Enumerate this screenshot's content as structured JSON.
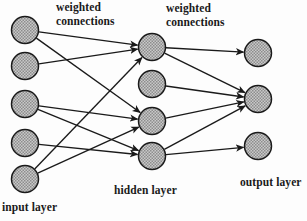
{
  "diagram": {
    "type": "neural-network-architecture",
    "title": "",
    "labels": {
      "weighted_connections_1": "weighted\nconnections",
      "weighted_connections_2": "weighted\nconnections",
      "hidden_layer": "hidden layer",
      "output_layer": "output layer",
      "input_layer": "input layer"
    },
    "colors": {
      "node_fill": "#a8a8a8",
      "node_stroke": "#1a1a1a",
      "edge": "#1a1a1a",
      "text": "#1a1a1a",
      "background": "#fdfdfd"
    },
    "node_radius": 13.5,
    "layers": [
      {
        "name": "input layer",
        "id": "input",
        "count": 5,
        "nodes": [
          {
            "id": "i1",
            "cx": 25,
            "cy": 30
          },
          {
            "id": "i2",
            "cx": 25,
            "cy": 66
          },
          {
            "id": "i3",
            "cx": 25,
            "cy": 104
          },
          {
            "id": "i4",
            "cx": 25,
            "cy": 143
          },
          {
            "id": "i5",
            "cx": 25,
            "cy": 179
          }
        ]
      },
      {
        "name": "hidden layer",
        "id": "hidden",
        "count": 4,
        "nodes": [
          {
            "id": "h1",
            "cx": 152,
            "cy": 47
          },
          {
            "id": "h2",
            "cx": 152,
            "cy": 84
          },
          {
            "id": "h3",
            "cx": 152,
            "cy": 121
          },
          {
            "id": "h4",
            "cx": 152,
            "cy": 156
          }
        ]
      },
      {
        "name": "output layer",
        "id": "output",
        "count": 3,
        "nodes": [
          {
            "id": "o1",
            "cx": 258,
            "cy": 53
          },
          {
            "id": "o2",
            "cx": 258,
            "cy": 99
          },
          {
            "id": "o3",
            "cx": 258,
            "cy": 146
          }
        ]
      }
    ],
    "edges": [
      {
        "from": "i1",
        "to": "h1"
      },
      {
        "from": "i1",
        "to": "h3"
      },
      {
        "from": "i2",
        "to": "h1"
      },
      {
        "from": "i3",
        "to": "h3"
      },
      {
        "from": "i3",
        "to": "h4"
      },
      {
        "from": "i4",
        "to": "h4"
      },
      {
        "from": "i5",
        "to": "h1"
      },
      {
        "from": "i5",
        "to": "h3"
      },
      {
        "from": "h1",
        "to": "o1"
      },
      {
        "from": "h1",
        "to": "o2"
      },
      {
        "from": "h2",
        "to": "o2"
      },
      {
        "from": "h3",
        "to": "o2"
      },
      {
        "from": "h4",
        "to": "o2"
      },
      {
        "from": "h4",
        "to": "o3"
      }
    ]
  }
}
